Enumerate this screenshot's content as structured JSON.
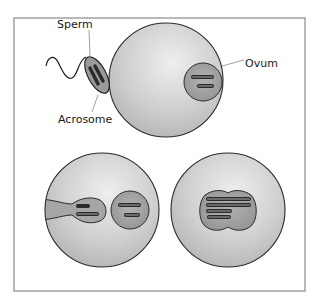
{
  "figure": {
    "labels": {
      "sperm": "Sperm",
      "acrosome": "Acrosome",
      "ovum": "Ovum"
    },
    "panels": [
      {
        "id": "panel-1",
        "description": "sperm approaching ovum"
      },
      {
        "id": "panel-2",
        "description": "sperm entering ovum"
      },
      {
        "id": "panel-3",
        "description": "nuclei fusing"
      }
    ],
    "colors": {
      "frame": "#8a8a8a",
      "cytoplasm_light": "#ececec",
      "cytoplasm_dark": "#b9b9b9",
      "nucleus": "#a4a4a4",
      "chromosome": "#5a5a5a",
      "outline": "#2a2a2a"
    }
  }
}
